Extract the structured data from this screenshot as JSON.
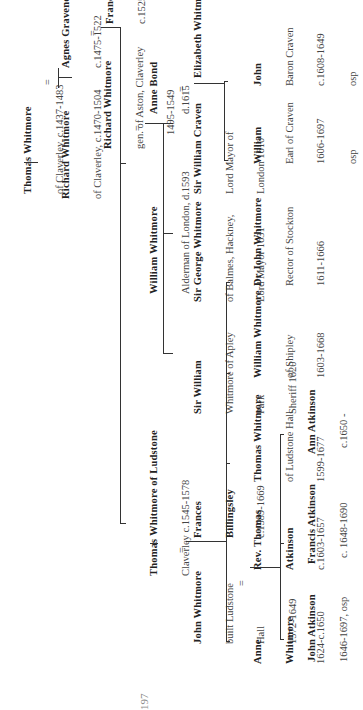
{
  "diagram": {
    "type": "family-tree",
    "orientation": "rotated-90-ccw",
    "people": {
      "thomas_1437": {
        "name": "Thomas Whitmore",
        "details": [
          "of Claverley, c.1437-1483"
        ]
      },
      "richard_1470": {
        "name": "Richard Whitmore",
        "details": [
          "of Claverley, c.1470-1504"
        ]
      },
      "agnes": {
        "name": "Agnes Gravenor",
        "details": [
          "c.1475-1522"
        ]
      },
      "richard_1495": {
        "name": "Richard Whitmore",
        "details": [
          "gen. of Aston, Claverley",
          "1495-1549"
        ]
      },
      "frances_barker": {
        "name": "Frances Barker",
        "details": [
          "c.1525-1583"
        ]
      },
      "thomas_1545": {
        "name": "Thomas Whitmore of Ludstone",
        "details": [
          "Claverley c.1545-1578"
        ]
      },
      "william_alderman": {
        "name": "William Whitmore",
        "details": [
          "Alderman of London, d.1593"
        ]
      },
      "anne_bond": {
        "name": "Anne Bond",
        "details": [
          "d.1615"
        ]
      },
      "john_1572": {
        "name": "John Whitmore",
        "details": [
          "built Ludstone",
          "Hall",
          "1572-1649"
        ]
      },
      "frances_billingsley": {
        "name": "Frances",
        "details": [
          "Billingsley",
          "c.1589-1669"
        ]
      },
      "sir_william_apley": {
        "name": "Sir William",
        "details": [
          "Whitmore of Apley",
          "Park",
          "Sheriff 1620"
        ]
      },
      "sir_george": {
        "name": "Sir George Whitmore",
        "details": [
          "of Balmes, Hackney,",
          "Lord Mayor 1631"
        ]
      },
      "sir_william_craven": {
        "name": "Sir William Craven",
        "details": [
          "Lord Mayor of",
          "London 1610"
        ]
      },
      "elizabeth": {
        "name": "Elizabeth Whitmore",
        "details": []
      },
      "anne_1624": {
        "name": "Anne",
        "details": [
          "Whitmore",
          "1624-c.1650"
        ]
      },
      "rev_thomas": {
        "name": "Rev. Thomas",
        "details": [
          "Atkinson",
          "c.1603-1657"
        ]
      },
      "thomas_1599": {
        "name": "Thomas Whitmore",
        "details": [
          "of Ludstone Hall",
          "1599-1677"
        ]
      },
      "william_shipley": {
        "name": "William Whitmore",
        "details": [
          "of Shipley",
          "1603-1668"
        ]
      },
      "dr_john": {
        "name": "Dr John Whitmore",
        "details": [
          "Rector of Stockton",
          "1611-1666"
        ]
      },
      "william_earl": {
        "name": "William",
        "details": [
          "Earl of Craven",
          "1606-1697",
          "osp"
        ]
      },
      "john_baron": {
        "name": "John",
        "details": [
          "Baron Craven",
          "c.1608-1649",
          "osp"
        ]
      },
      "john_atkinson": {
        "name": "John Atkinson",
        "details": [
          "1646-1697, osp"
        ]
      },
      "francis_atkinson": {
        "name": "Francis Atkinson",
        "details": [
          "c. 1648-1690"
        ]
      },
      "ann_atkinson": {
        "name": "Ann Atkinson",
        "details": [
          "c.1650 -"
        ]
      }
    },
    "marriage_symbol": "=",
    "page_number": "197",
    "colors": {
      "background": "#ffffff",
      "text": "#2a2a2a",
      "lines": "#333333"
    }
  }
}
